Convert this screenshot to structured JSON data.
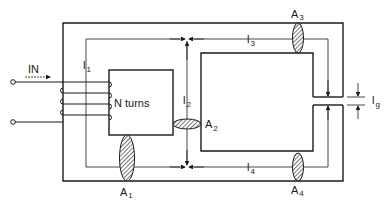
{
  "diagram": {
    "type": "magnetic-circuit",
    "colors": {
      "ink": "#1a1a1a",
      "background": "#ffffff"
    },
    "input_label": "IN",
    "winding_label": "N turns",
    "path_lengths": [
      {
        "id": "l1",
        "main": "l",
        "sub": "1"
      },
      {
        "id": "l2",
        "main": "l",
        "sub": "2"
      },
      {
        "id": "l3",
        "main": "l",
        "sub": "3"
      },
      {
        "id": "l4",
        "main": "l",
        "sub": "4"
      },
      {
        "id": "lg",
        "main": "l",
        "sub": "g"
      }
    ],
    "cross_sections": [
      {
        "id": "A1",
        "main": "A",
        "sub": "1"
      },
      {
        "id": "A2",
        "main": "A",
        "sub": "2"
      },
      {
        "id": "A3",
        "main": "A",
        "sub": "3"
      },
      {
        "id": "A4",
        "main": "A",
        "sub": "4"
      }
    ]
  }
}
